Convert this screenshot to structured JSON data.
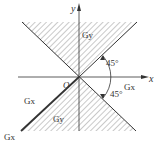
{
  "diagram": {
    "axes": {
      "x_label": "x",
      "y_label": "y",
      "origin_label": "O"
    },
    "regions": {
      "upper_label": "Gy",
      "lower_label": "Gy"
    },
    "boundary_labels": {
      "right_label": "Gx",
      "left_label": "Gx",
      "bottom_left_label": "Gx"
    },
    "angles": {
      "upper": "45°",
      "lower": "45°"
    },
    "colors": {
      "line": "#333333",
      "hatch": "#777777",
      "background": "#ffffff"
    }
  }
}
